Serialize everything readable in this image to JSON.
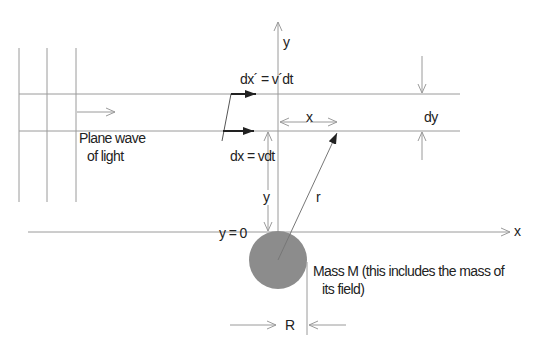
{
  "diagram": {
    "labels": {
      "y_axis": "y",
      "x_axis": "x",
      "dx_prime": "dx´ = v´dt",
      "dx": "dx = vdt",
      "x_dist": "x",
      "dy": "dy",
      "plane_wave_line1": "Plane wave",
      "plane_wave_line2": "of light",
      "y_dist": "y",
      "r": "r",
      "y_zero": "y = 0",
      "mass_line1": "Mass M (this includes the mass of",
      "mass_line2": "its field)",
      "R": "R"
    },
    "colors": {
      "line": "#9a9a9a",
      "dark_arrow": "#222222",
      "mass_fill": "#8c8c8c",
      "text": "#222222"
    }
  }
}
